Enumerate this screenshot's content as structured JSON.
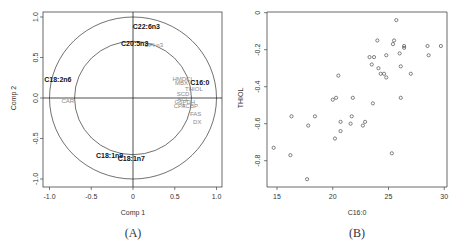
{
  "panels": {
    "A": {
      "caption": "(A)"
    },
    "B": {
      "caption": "(B)"
    }
  },
  "chart_data": [
    {
      "type": "scatter",
      "subtype": "correlation-circle",
      "title": "",
      "xlabel": "Comp 1",
      "ylabel": "Comp 2",
      "xlim": [
        -1.0,
        1.0
      ],
      "ylim": [
        -1.0,
        1.0
      ],
      "xticks": [
        "-1.0",
        "-0.5",
        "0",
        "0.5",
        "1.0"
      ],
      "yticks": [
        "1.0",
        "0.5",
        "0.0",
        "-0.5",
        "-1.0"
      ],
      "circles": [
        {
          "radius": 1.0
        },
        {
          "radius": 0.7
        }
      ],
      "grid": false,
      "variables_bold": [
        {
          "label": "C22:6n3",
          "x": 0.16,
          "y": 0.87
        },
        {
          "label": "C20:5n3",
          "x": 0.02,
          "y": 0.67
        },
        {
          "label": "C18:2n6",
          "x": -0.9,
          "y": 0.22
        },
        {
          "label": "C16:0",
          "x": 0.8,
          "y": 0.18
        },
        {
          "label": "C18:1n9",
          "x": -0.28,
          "y": -0.72
        },
        {
          "label": "C18:1n7",
          "x": -0.02,
          "y": -0.76
        }
      ],
      "variables_gray": [
        {
          "label": "DPI n3",
          "x": 0.25,
          "y": 0.65
        },
        {
          "label": "HMDCL",
          "x": 0.6,
          "y": 0.23
        },
        {
          "label": "MBX",
          "x": 0.58,
          "y": 0.18
        },
        {
          "label": "THIOL",
          "x": 0.73,
          "y": 0.1
        },
        {
          "label": "SCD",
          "x": 0.6,
          "y": 0.05
        },
        {
          "label": "ACL",
          "x": 0.6,
          "y": -0.02
        },
        {
          "label": "G6PDH",
          "x": 0.62,
          "y": -0.05
        },
        {
          "label": "CPT",
          "x": 0.56,
          "y": -0.1
        },
        {
          "label": "ACBP",
          "x": 0.68,
          "y": -0.1
        },
        {
          "label": "FAS",
          "x": 0.75,
          "y": -0.2
        },
        {
          "label": "DX",
          "x": 0.77,
          "y": -0.3
        },
        {
          "label": "CAR",
          "x": -0.78,
          "y": -0.04
        }
      ]
    },
    {
      "type": "scatter",
      "title": "",
      "xlabel": "C16:0",
      "ylabel": "THIOL",
      "xlim": [
        14.5,
        30.2
      ],
      "ylim": [
        -0.94,
        0.0
      ],
      "xticks": [
        "15",
        "20",
        "25",
        "30"
      ],
      "yticks": [
        "0",
        "-0.2",
        "-0.4",
        "-0.6",
        "-0.8"
      ],
      "grid": false,
      "x": [
        25.7,
        24.0,
        25.5,
        25.4,
        26.4,
        26.4,
        28.5,
        29.7,
        26.0,
        24.8,
        28.6,
        23.3,
        23.7,
        23.5,
        24.1,
        26.1,
        24.3,
        24.6,
        24.8,
        27.0,
        20.5,
        20.0,
        20.3,
        21.8,
        26.1,
        23.6,
        16.3,
        18.4,
        21.7,
        17.8,
        20.7,
        21.6,
        22.7,
        22.9,
        20.7,
        20.2,
        14.7,
        16.2,
        17.7,
        25.3
      ],
      "y": [
        -0.04,
        -0.15,
        -0.15,
        -0.17,
        -0.18,
        -0.19,
        -0.18,
        -0.18,
        -0.22,
        -0.23,
        -0.23,
        -0.24,
        -0.24,
        -0.28,
        -0.3,
        -0.29,
        -0.33,
        -0.33,
        -0.35,
        -0.33,
        -0.34,
        -0.47,
        -0.46,
        -0.46,
        -0.46,
        -0.49,
        -0.56,
        -0.56,
        -0.56,
        -0.61,
        -0.59,
        -0.6,
        -0.61,
        -0.59,
        -0.64,
        -0.68,
        -0.73,
        -0.77,
        -0.9,
        -0.76
      ]
    }
  ]
}
